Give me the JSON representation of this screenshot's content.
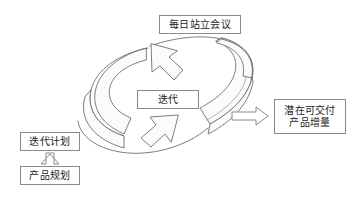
{
  "canvas": {
    "width": 355,
    "height": 197,
    "background_color": "#ffffff",
    "stroke_color": "#8a8a8a",
    "text_color": "#1a1a1a",
    "ribbon_fill": "#fbfbfb"
  },
  "diagram": {
    "type": "cycle-flow-diagram",
    "nodes": {
      "daily_standup": {
        "label": "每日站立会议",
        "icon": "rectangle-node"
      },
      "iteration": {
        "label": "迭代",
        "icon": "rectangle-node"
      },
      "increment": {
        "label": "潜在可交付\n产品增量",
        "icon": "rectangle-node"
      },
      "iteration_plan": {
        "label": "迭代计划",
        "icon": "rectangle-node"
      },
      "product_plan": {
        "label": "产品规划",
        "icon": "rectangle-node"
      }
    },
    "connectors": {
      "product_to_plan": {
        "icon": "block-arrow-up-icon",
        "direction": "up",
        "from": "product_plan",
        "to": "iteration_plan"
      },
      "iteration_to_increment": {
        "icon": "block-arrow-right-icon",
        "direction": "right",
        "from": "iteration",
        "to": "increment"
      },
      "cycle_ribbon": {
        "icon": "circular-cycle-arrow-icon",
        "description": "两个首尾相接的弧形箭头构成循环",
        "arrowhead_upper_direction": "down-left",
        "arrowhead_lower_direction": "up-right"
      }
    }
  }
}
